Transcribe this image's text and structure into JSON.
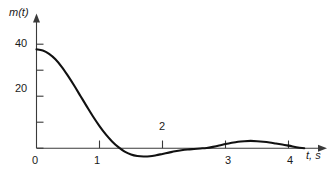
{
  "chart_data": {
    "type": "line",
    "title": "",
    "xlabel": "t, s",
    "ylabel": "m(t)",
    "xlim": [
      0,
      4.55
    ],
    "ylim": [
      -8,
      46
    ],
    "grid": false,
    "legend": null,
    "x_ticks": [
      {
        "value": 0,
        "label": "0"
      },
      {
        "value": 1,
        "label": "1"
      },
      {
        "value": 2,
        "label": "2"
      },
      {
        "value": 3,
        "label": "3"
      },
      {
        "value": 4,
        "label": "4"
      }
    ],
    "y_ticks": [
      {
        "value": 0,
        "label": ""
      },
      {
        "value": 10,
        "label": ""
      },
      {
        "value": 20,
        "label": "20"
      },
      {
        "value": 30,
        "label": ""
      },
      {
        "value": 40,
        "label": "40"
      }
    ],
    "series": [
      {
        "name": "m(t)",
        "color": "#111111",
        "x": [
          0.0,
          0.1,
          0.2,
          0.3,
          0.4,
          0.5,
          0.6,
          0.7,
          0.8,
          0.9,
          1.0,
          1.1,
          1.2,
          1.3,
          1.4,
          1.5,
          1.6,
          1.7,
          1.8,
          1.9,
          2.0,
          2.1,
          2.2,
          2.3,
          2.4,
          2.5,
          2.6,
          2.7,
          2.8,
          2.9,
          3.0,
          3.1,
          3.2,
          3.3,
          3.4,
          3.5,
          3.6,
          3.7,
          3.8,
          3.9,
          4.0
        ],
        "y": [
          38.0,
          37.6,
          36.3,
          34.2,
          31.3,
          27.8,
          24.0,
          20.0,
          16.0,
          12.1,
          8.5,
          5.3,
          2.6,
          0.4,
          -1.3,
          -2.4,
          -3.0,
          -3.2,
          -3.1,
          -2.7,
          -2.2,
          -1.7,
          -1.2,
          -0.8,
          -0.5,
          -0.3,
          -0.1,
          0.1,
          0.5,
          1.0,
          1.6,
          2.1,
          2.5,
          2.7,
          2.8,
          2.7,
          2.5,
          2.2,
          1.8,
          1.4,
          1.0
        ]
      }
    ],
    "annotations": {
      "initial_value": 38,
      "first_zero_crossing": 1.28,
      "minimum": {
        "t": 1.7,
        "m": -3.2
      },
      "second_zero_crossing": 2.72,
      "maximum_rebound": {
        "t": 3.4,
        "m": 2.8
      }
    },
    "axis_arrows": {
      "x": true,
      "y": true
    }
  }
}
